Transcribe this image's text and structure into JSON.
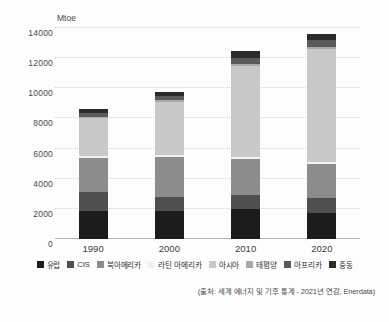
{
  "chart_data": {
    "type": "bar",
    "stacked": true,
    "title": "",
    "subtitle": "",
    "xlabel": "",
    "ylabel": "Mtoe",
    "ylim": [
      0,
      14000
    ],
    "ytick_values": [
      0,
      2000,
      4000,
      6000,
      8000,
      10000,
      12000,
      14000
    ],
    "ytick_labels": [
      "0",
      "2000",
      "4000",
      "6000",
      "8000",
      "10000",
      "12000",
      "14000"
    ],
    "grid": true,
    "grid_style": "dotted",
    "legend_position": "bottom",
    "categories": [
      "1990",
      "2000",
      "2010",
      "2020"
    ],
    "series": [
      {
        "name": "유럽",
        "color": "#1c1c1c",
        "values": [
          1850,
          1880,
          1980,
          1700
        ]
      },
      {
        "name": "CIS",
        "color": "#4f4f4f",
        "values": [
          1250,
          930,
          930,
          1000
        ]
      },
      {
        "name": "북아메리카",
        "color": "#8c8c8c",
        "values": [
          2270,
          2620,
          2420,
          2280
        ]
      },
      {
        "name": "라틴 아메리카",
        "color": "#f2f2f2",
        "values": [
          110,
          120,
          140,
          150
        ]
      },
      {
        "name": "아시아",
        "color": "#c8c8c8",
        "values": [
          2520,
          3560,
          5990,
          7450
        ]
      },
      {
        "name": "태평양",
        "color": "#a8a8a8",
        "values": [
          120,
          130,
          140,
          160
        ]
      },
      {
        "name": "아프리카",
        "color": "#5a5a5a",
        "values": [
          230,
          270,
          400,
          470
        ]
      },
      {
        "name": "중동",
        "color": "#2b2b2b",
        "values": [
          250,
          240,
          500,
          390
        ]
      }
    ],
    "totals": [
      8600,
      9750,
      12500,
      13600
    ],
    "source_note": "(출처: 세계 에너지 및 기후 통계 - 2021년 연감, Enerdata)"
  },
  "axis": {
    "y_unit_label": "Mtoe"
  }
}
